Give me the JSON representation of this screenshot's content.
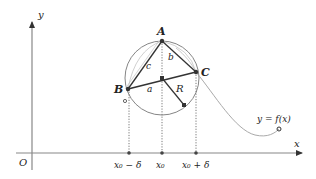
{
  "diagram": {
    "axes": {
      "x_label": "x",
      "y_label": "y",
      "origin_label": "O"
    },
    "points": {
      "A": "A",
      "B": "B",
      "C": "C"
    },
    "sides": {
      "a": "a",
      "b": "b",
      "c": "c",
      "R": "R"
    },
    "ticks": [
      "x₀ − δ",
      "x₀",
      "x₀ + δ"
    ],
    "function_label": "y = f(x)",
    "colors": {
      "stroke": "#333333",
      "light": "#999999",
      "curve": "#aaaaaa",
      "point": "#333333"
    }
  }
}
